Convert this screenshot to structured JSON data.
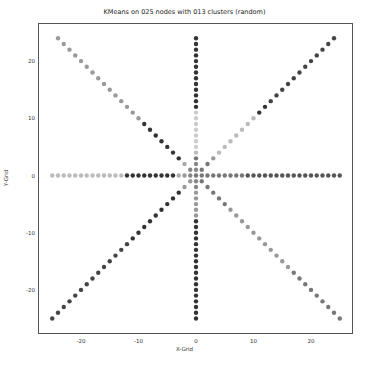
{
  "chart_data": {
    "type": "scatter",
    "title": "KMeans on 025 nodes with 013 clusters (random)",
    "xlabel": "X-Grid",
    "ylabel": "Y-Grid",
    "xlim": [
      -26.5,
      27
    ],
    "ylim": [
      -26.5,
      26.5
    ],
    "xticks": [
      -20,
      -10,
      0,
      10,
      20
    ],
    "yticks": [
      -20,
      -10,
      0,
      10,
      20
    ],
    "grid": false,
    "legend": "none",
    "arms": [
      {
        "name": "north",
        "dx": 0,
        "dy": 1,
        "range": [
          1,
          24
        ],
        "shades": [
          "#888",
          "#888",
          "#777",
          "#bbb",
          "#ccc",
          "#ccc",
          "#ccc",
          "#ccc",
          "#ccc",
          "#ccc",
          "#ccc",
          "#333",
          "#333",
          "#333",
          "#333",
          "#333",
          "#333",
          "#333",
          "#333",
          "#333",
          "#333",
          "#333",
          "#333",
          "#333"
        ]
      },
      {
        "name": "south",
        "dx": 0,
        "dy": -1,
        "range": [
          1,
          25
        ],
        "shades": [
          "#888",
          "#888",
          "#999",
          "#999",
          "#999",
          "#999",
          "#999",
          "#333",
          "#333",
          "#333",
          "#333",
          "#333",
          "#333",
          "#333",
          "#333",
          "#333",
          "#333",
          "#333",
          "#333",
          "#333",
          "#333",
          "#333",
          "#333",
          "#333",
          "#333"
        ]
      },
      {
        "name": "west",
        "dx": -1,
        "dy": 0,
        "range": [
          1,
          25
        ],
        "shades": [
          "#888",
          "#999",
          "#aaa",
          "#333",
          "#333",
          "#333",
          "#333",
          "#333",
          "#333",
          "#333",
          "#333",
          "#333",
          "#bbb",
          "#bbb",
          "#bbb",
          "#bbb",
          "#bbb",
          "#bbb",
          "#bbb",
          "#bbb",
          "#bbb",
          "#bbb",
          "#bbb",
          "#bbb",
          "#bbb"
        ]
      },
      {
        "name": "east",
        "dx": 1,
        "dy": 0,
        "range": [
          1,
          25
        ],
        "shades": [
          "#777",
          "#777",
          "#777",
          "#777",
          "#777",
          "#777",
          "#777",
          "#777",
          "#555",
          "#555",
          "#555",
          "#555",
          "#555",
          "#555",
          "#555",
          "#555",
          "#555",
          "#555",
          "#555",
          "#555",
          "#555",
          "#555",
          "#555",
          "#555",
          "#555"
        ]
      },
      {
        "name": "northwest",
        "dx": -1,
        "dy": 1,
        "range": [
          1,
          24
        ],
        "shades": [
          "#888",
          "#aaa",
          "#333",
          "#333",
          "#333",
          "#333",
          "#333",
          "#333",
          "#333",
          "#999",
          "#999",
          "#999",
          "#999",
          "#999",
          "#999",
          "#999",
          "#999",
          "#999",
          "#999",
          "#999",
          "#999",
          "#999",
          "#999",
          "#999"
        ]
      },
      {
        "name": "northeast",
        "dx": 1,
        "dy": 1,
        "range": [
          1,
          24
        ],
        "shades": [
          "#777",
          "#777",
          "#999",
          "#bbb",
          "#bbb",
          "#bbb",
          "#bbb",
          "#bbb",
          "#bbb",
          "#bbb",
          "#333",
          "#333",
          "#444",
          "#444",
          "#444",
          "#444",
          "#444",
          "#444",
          "#444",
          "#444",
          "#444",
          "#444",
          "#444",
          "#444"
        ]
      },
      {
        "name": "southwest",
        "dx": -1,
        "dy": -1,
        "range": [
          1,
          25
        ],
        "shades": [
          "#999",
          "#999",
          "#333",
          "#333",
          "#333",
          "#333",
          "#333",
          "#333",
          "#333",
          "#333",
          "#333",
          "#444",
          "#444",
          "#444",
          "#444",
          "#444",
          "#444",
          "#444",
          "#444",
          "#444",
          "#444",
          "#444",
          "#444",
          "#444",
          "#444"
        ]
      },
      {
        "name": "southeast",
        "dx": 1,
        "dy": -1,
        "range": [
          1,
          25
        ],
        "shades": [
          "#777",
          "#777",
          "#777",
          "#777",
          "#777",
          "#999",
          "#999",
          "#999",
          "#999",
          "#999",
          "#999",
          "#999",
          "#999",
          "#999",
          "#999",
          "#999",
          "#777",
          "#777",
          "#777",
          "#777",
          "#777",
          "#777",
          "#777",
          "#777",
          "#777"
        ]
      }
    ],
    "center_shade": "#777"
  }
}
